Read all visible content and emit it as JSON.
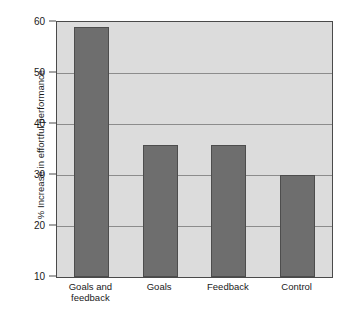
{
  "chart_data": {
    "type": "bar",
    "title": "",
    "subtitle": "",
    "xlabel": "",
    "ylabel": "% Increase in effortful performance",
    "categories": [
      "Goals and\nfeedback",
      "Goals",
      "Feedback",
      "Control"
    ],
    "values": [
      59,
      35.8,
      35.8,
      30
    ],
    "ylim": [
      10,
      60
    ],
    "yticks": [
      10,
      20,
      30,
      40,
      50,
      60
    ],
    "ytick_labels": [
      "10",
      "20",
      "30",
      "40",
      "50",
      "60"
    ],
    "grid": "horizontal",
    "legend": "none",
    "bar_color": "#6e6e6e",
    "plot_background": "#dcdcdc",
    "gridline_color": "#8c8c8c",
    "axis_color": "#4a4a4a",
    "figure_background": "#ffffff"
  }
}
